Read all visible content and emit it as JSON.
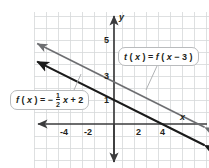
{
  "figure": {
    "kind": "coordinate-plane-graph",
    "width": 209,
    "height": 168,
    "background": "#ffffff",
    "grid_color": "#d6d8da",
    "axis_color": "#3b3b3d",
    "text_color": "#231f20"
  },
  "axes": {
    "x_axis_label": "x",
    "y_axis_label": "y",
    "x_tick_labels": [
      "-4",
      "-2",
      "2",
      "4"
    ],
    "x_tick_values": [
      -4,
      -2,
      2,
      4
    ],
    "y_tick_labels": [
      "1",
      "3",
      "5"
    ],
    "y_tick_values": [
      1,
      3,
      5
    ],
    "xlim": [
      -6.75,
      7.9
    ],
    "ylim": [
      -3.7,
      9.3
    ],
    "grid": true,
    "grid_step": 1
  },
  "callouts": [
    {
      "id": "t",
      "name": "t-function-label",
      "text": "t(x) = f(x − 3)",
      "parts": {
        "lhs_fn": "t",
        "lhs_var": "x",
        "equals": "=",
        "rhs_fn": "f",
        "rhs_var": "x",
        "rhs_op": "−",
        "rhs_shift": "3"
      }
    },
    {
      "id": "f",
      "name": "f-function-label",
      "text": "f(x) = -1/2 x + 2",
      "parts": {
        "lhs_fn": "f",
        "lhs_var": "x",
        "equals": "=",
        "sign": "−",
        "num": "1",
        "den": "2",
        "var": "x",
        "plus": "+",
        "constant": "2"
      }
    }
  ],
  "chart_data": {
    "type": "line",
    "title": "",
    "xlabel": "x",
    "ylabel": "y",
    "xlim": [
      -6.75,
      7.9
    ],
    "ylim": [
      -3.7,
      9.3
    ],
    "grid": true,
    "legend": "callout-labels",
    "series": [
      {
        "name": "f(x) = -1/2x + 2",
        "label": "f(x) = −1/2x + 2",
        "color": "#1a1a1a",
        "width": 2.1,
        "slope": -0.5,
        "intercept": 2,
        "x_intercept": 4,
        "arrows": "both",
        "points": [
          {
            "x": -6.75,
            "y": 5.375
          },
          {
            "x": -4,
            "y": 4
          },
          {
            "x": -2,
            "y": 3
          },
          {
            "x": 0,
            "y": 2
          },
          {
            "x": 2,
            "y": 1
          },
          {
            "x": 4,
            "y": 0
          },
          {
            "x": 6,
            "y": -1
          }
        ]
      },
      {
        "name": "t(x) = f(x - 3)",
        "label": "t(x) = f(x − 3)",
        "color": "#6d6e71",
        "width": 1.7,
        "slope": -0.5,
        "intercept": 3.5,
        "x_intercept": 7,
        "arrows": "both",
        "points": [
          {
            "x": -6.75,
            "y": 6.875
          },
          {
            "x": -4,
            "y": 5.5
          },
          {
            "x": -2,
            "y": 4.5
          },
          {
            "x": 0,
            "y": 3.5
          },
          {
            "x": 2,
            "y": 2.5
          },
          {
            "x": 4,
            "y": 1.5
          },
          {
            "x": 6,
            "y": 0.5
          }
        ]
      }
    ]
  }
}
